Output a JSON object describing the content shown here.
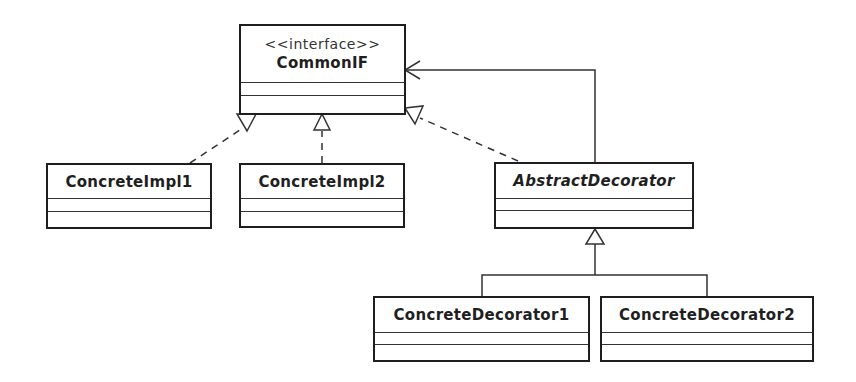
{
  "diagram": {
    "type": "UML class diagram",
    "classes": [
      {
        "id": "commonif",
        "stereotype": "<<interface>>",
        "name": "CommonIF",
        "abstract": false
      },
      {
        "id": "impl1",
        "name": "ConcreteImpl1",
        "abstract": false
      },
      {
        "id": "impl2",
        "name": "ConcreteImpl2",
        "abstract": false
      },
      {
        "id": "absdec",
        "name": "AbstractDecorator",
        "abstract": true
      },
      {
        "id": "dec1",
        "name": "ConcreteDecorator1",
        "abstract": false
      },
      {
        "id": "dec2",
        "name": "ConcreteDecorator2",
        "abstract": false
      }
    ],
    "relations": [
      {
        "from": "ConcreteImpl1",
        "to": "CommonIF",
        "kind": "realization"
      },
      {
        "from": "ConcreteImpl2",
        "to": "CommonIF",
        "kind": "realization"
      },
      {
        "from": "AbstractDecorator",
        "to": "CommonIF",
        "kind": "realization"
      },
      {
        "from": "AbstractDecorator",
        "to": "CommonIF",
        "kind": "association"
      },
      {
        "from": "ConcreteDecorator1",
        "to": "AbstractDecorator",
        "kind": "generalization"
      },
      {
        "from": "ConcreteDecorator2",
        "to": "AbstractDecorator",
        "kind": "generalization"
      }
    ],
    "colors": {
      "line": "#1e1e1e",
      "background": "#ffffff"
    }
  }
}
